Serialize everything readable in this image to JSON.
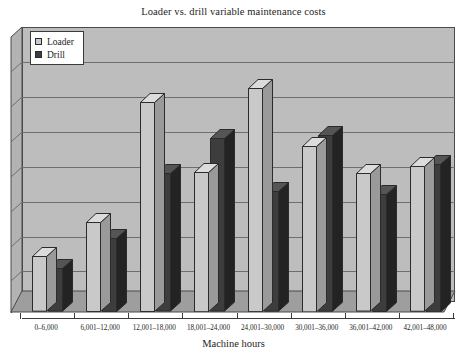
{
  "chart_data": {
    "type": "bar",
    "title": "Loader vs. drill variable maintenance costs",
    "xlabel": "Machine hours",
    "ylabel": "",
    "grid": true,
    "legend_position": "top-left",
    "axis_ranges": {
      "ylim": [
        0,
        8
      ],
      "y_gridline_count": 8,
      "y_tick_labels_shown": false
    },
    "categories": [
      "0–6,000",
      "6,001–12,000",
      "12,001–18,000",
      "18,001–24,000",
      "24,001–30,000",
      "30,001–36,000",
      "36,001–42,000",
      "42,001–48,000"
    ],
    "series": [
      {
        "name": "Loader",
        "color": "#c9c9c9",
        "values": [
          1.62,
          2.62,
          6.11,
          4.08,
          6.52,
          4.84,
          4.03,
          4.24
        ]
      },
      {
        "name": "Drill",
        "color": "#3d3d3d",
        "values": [
          1.27,
          2.16,
          4.03,
          5.05,
          3.51,
          5.14,
          3.43,
          4.32
        ]
      }
    ]
  },
  "legend": {
    "items": [
      {
        "label": "Loader",
        "swatch": "loader"
      },
      {
        "label": "Drill",
        "swatch": "drill"
      }
    ]
  }
}
